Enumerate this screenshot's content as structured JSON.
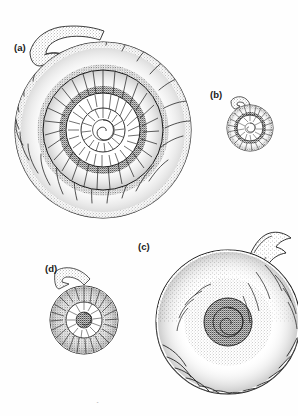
{
  "plate": {
    "width": 298,
    "height": 416,
    "background_color": "#fefefe",
    "ink_color": "#1a1a1a",
    "medium": "pen-and-ink stipple scientific illustration",
    "subject": "ammonite fossil specimens",
    "caption_partial": "cut-off caption text"
  },
  "labels": {
    "a": "(a)",
    "b": "(b)",
    "c": "(c)",
    "d": "(d)"
  },
  "specimens": [
    {
      "id": "a",
      "label": "(a)",
      "description": "large coiled ammonite with strong radial ribs and flared hook-shaped lappet at upper left",
      "center_x": 103,
      "center_y": 130,
      "outer_radius": 88,
      "whorl_count": 4,
      "outer_rib_count": 22,
      "has_lappet": true
    },
    {
      "id": "b",
      "label": "(b)",
      "description": "small finely ribbed ammonite with short lappet at upper left",
      "center_x": 250,
      "center_y": 128,
      "outer_radius": 23,
      "whorl_count": 3,
      "outer_rib_count": 34,
      "has_lappet": true
    },
    {
      "id": "c",
      "label": "(c)",
      "description": "large smooth stippled ammonite with tall curved rostrum and ribbed ventral margin",
      "center_x": 228,
      "center_y": 322,
      "outer_radius": 72,
      "whorl_count": 3,
      "outer_rib_count": 26,
      "has_lappet": true
    },
    {
      "id": "d",
      "label": "(d)",
      "description": "small dark densely ribbed ammonite with pointed lappet at upper left",
      "center_x": 84,
      "center_y": 320,
      "outer_radius": 34,
      "whorl_count": 3,
      "outer_rib_count": 40,
      "has_lappet": true
    }
  ]
}
